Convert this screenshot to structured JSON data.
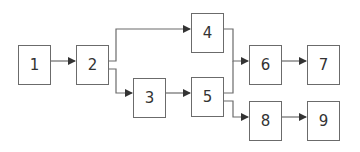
{
  "diagram": {
    "type": "flowchart",
    "nodes": [
      {
        "id": "1",
        "label": "1",
        "x": 18,
        "y": 45
      },
      {
        "id": "2",
        "label": "2",
        "x": 76,
        "y": 45
      },
      {
        "id": "3",
        "label": "3",
        "x": 133,
        "y": 78
      },
      {
        "id": "4",
        "label": "4",
        "x": 191,
        "y": 13
      },
      {
        "id": "5",
        "label": "5",
        "x": 191,
        "y": 77
      },
      {
        "id": "6",
        "label": "6",
        "x": 249,
        "y": 45
      },
      {
        "id": "7",
        "label": "7",
        "x": 307,
        "y": 45
      },
      {
        "id": "8",
        "label": "8",
        "x": 249,
        "y": 101
      },
      {
        "id": "9",
        "label": "9",
        "x": 307,
        "y": 101
      }
    ],
    "edges": [
      {
        "from": "1",
        "to": "2"
      },
      {
        "from": "2",
        "to": "4"
      },
      {
        "from": "2",
        "to": "3"
      },
      {
        "from": "3",
        "to": "5"
      },
      {
        "from": "4",
        "to": "6"
      },
      {
        "from": "5",
        "to": "6"
      },
      {
        "from": "5",
        "to": "8"
      },
      {
        "from": "6",
        "to": "7"
      },
      {
        "from": "8",
        "to": "9"
      }
    ],
    "colors": {
      "line": "#6b6b6b",
      "text": "#333333"
    }
  }
}
